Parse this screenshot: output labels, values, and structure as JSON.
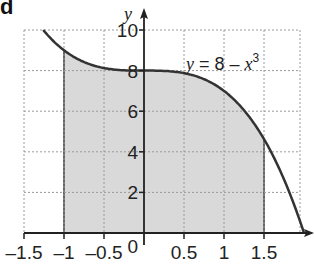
{
  "part_label": "d",
  "colors": {
    "curve": "#333333",
    "shade": "#d9d9d9",
    "shade_edge": "#666666",
    "grid": "#9a9a9a",
    "axis": "#222222"
  },
  "chart_data": {
    "type": "area",
    "title": "",
    "function": "y = 8 - x^3",
    "equation_label": {
      "prefix": "y = 8 – ",
      "var": "x",
      "exp": "3"
    },
    "xlabel": "",
    "ylabel": "y",
    "xlim": [
      -1.5,
      2
    ],
    "ylim": [
      0,
      10
    ],
    "x_ticks": [
      -1.5,
      -1,
      -0.5,
      0,
      0.5,
      1,
      1.5
    ],
    "x_tick_labels": [
      "-1.5",
      "-1",
      "-0.5",
      "0",
      "0.5",
      "1",
      "1.5"
    ],
    "y_ticks": [
      2,
      4,
      6,
      8,
      10
    ],
    "y_tick_labels": [
      "2",
      "4",
      "6",
      "8",
      "10"
    ],
    "grid": true,
    "shaded_region": {
      "x_from": -1,
      "x_to": 1.5,
      "description": "area under y = 8 - x^3 between x = -1 and x = 1.5"
    },
    "sample_points": [
      {
        "x": -1.26,
        "y": 10.0
      },
      {
        "x": -1.0,
        "y": 9.0
      },
      {
        "x": -0.5,
        "y": 8.125
      },
      {
        "x": 0.0,
        "y": 8.0
      },
      {
        "x": 0.5,
        "y": 7.875
      },
      {
        "x": 1.0,
        "y": 7.0
      },
      {
        "x": 1.5,
        "y": 4.625
      },
      {
        "x": 2.0,
        "y": 0.0
      }
    ]
  }
}
